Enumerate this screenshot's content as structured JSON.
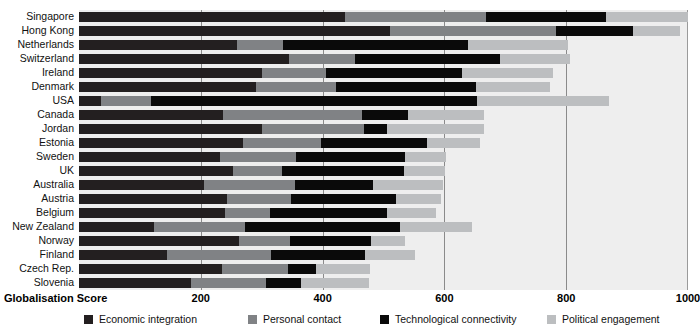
{
  "chart_data": {
    "type": "bar",
    "orientation": "horizontal",
    "stacked": true,
    "title": "",
    "xlabel": "Globalisation Score",
    "ylabel": "",
    "xlim": [
      0,
      1000
    ],
    "xticks": [
      200,
      400,
      600,
      800,
      1000
    ],
    "xtick_labels": [
      "200",
      "400",
      "600",
      "800",
      "1000"
    ],
    "grid": true,
    "legend_position": "bottom",
    "categories": [
      "Singapore",
      "Hong Kong",
      "Netherlands",
      "Switzerland",
      "Ireland",
      "Denmark",
      "USA",
      "Canada",
      "Jordan",
      "Estonia",
      "Sweden",
      "UK",
      "Australia",
      "Austria",
      "Belgium",
      "New Zealand",
      "Norway",
      "Finland",
      "Czech Rep.",
      "Slovenia"
    ],
    "series": [
      {
        "name": "Economic integration",
        "color": "#231f20",
        "values": [
          437,
          510,
          260,
          345,
          300,
          290,
          36,
          237,
          300,
          269,
          232,
          253,
          205,
          243,
          239,
          123,
          262,
          145,
          234,
          184
        ]
      },
      {
        "name": "Personal contact",
        "color": "#808285",
        "values": [
          232,
          274,
          75,
          108,
          105,
          132,
          83,
          228,
          168,
          128,
          124,
          80,
          150,
          105,
          75,
          150,
          85,
          170,
          110,
          123
        ]
      },
      {
        "name": "Technological connectivity",
        "color": "#0a0a0a",
        "values": [
          197,
          126,
          303,
          238,
          224,
          230,
          534,
          75,
          37,
          175,
          180,
          200,
          127,
          173,
          192,
          254,
          132,
          155,
          45,
          58
        ]
      },
      {
        "name": "Political engagement",
        "color": "#bcbec0",
        "values": [
          134,
          77,
          165,
          115,
          150,
          121,
          218,
          125,
          160,
          86,
          67,
          68,
          115,
          73,
          81,
          118,
          56,
          82,
          89,
          112
        ]
      }
    ],
    "totals": [
      1000,
      987,
      803,
      806,
      779,
      773,
      871,
      665,
      665,
      658,
      603,
      601,
      597,
      594,
      587,
      645,
      535,
      552,
      478,
      477
    ]
  },
  "legend": {
    "items": [
      {
        "label": "Economic integration",
        "color": "#231f20",
        "x": 84
      },
      {
        "label": "Personal contact",
        "color": "#808285",
        "x": 248
      },
      {
        "label": "Technological connectivity",
        "color": "#0a0a0a",
        "x": 380
      },
      {
        "label": "Political engagement",
        "color": "#bcbec0",
        "x": 547
      }
    ]
  },
  "axis": {
    "title": "Globalisation Score"
  },
  "plot": {
    "background": "#eeeeee",
    "gridline_color": "#8a8a8a",
    "left_px": 79,
    "right_px": 688,
    "top_px": 10,
    "bottom_px": 290
  }
}
